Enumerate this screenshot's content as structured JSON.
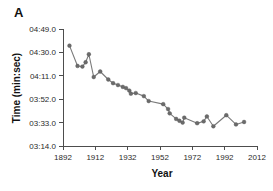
{
  "figure": {
    "panel_label": "A",
    "background_color": "#ffffff",
    "line_color": "#7a7a7a",
    "marker_color": "#6b6b6b",
    "axis_color": "#4d4d4d"
  },
  "chart_data": {
    "type": "line",
    "title": "",
    "xlabel": "Year",
    "ylabel": "Time (min:sec)",
    "xlim": [
      1892,
      2012
    ],
    "ylim": [
      194,
      289
    ],
    "xticks": [
      1892,
      1912,
      1932,
      1952,
      1972,
      1992,
      2012
    ],
    "xtick_labels": [
      "1892",
      "1912",
      "1932",
      "1952",
      "1972",
      "1992",
      "2012"
    ],
    "yticks": [
      194,
      213,
      232,
      251,
      270,
      289
    ],
    "ytick_labels": [
      "03:14.0",
      "03:33.0",
      "03:52.0",
      "04:11.0",
      "04:30.0",
      "04:49.0"
    ],
    "grid": false,
    "legend": false,
    "series": [
      {
        "name": "Mile record time",
        "x": [
          1896,
          1901,
          1904,
          1906,
          1908,
          1911,
          1915,
          1920,
          1923,
          1926,
          1929,
          1931,
          1933,
          1934,
          1937,
          1942,
          1945,
          1954,
          1957,
          1958,
          1962,
          1964,
          1966,
          1967,
          1975,
          1979,
          1981,
          1985,
          1993,
          1999,
          2004
        ],
        "y": [
          275.5,
          259.0,
          258.5,
          262.0,
          268.5,
          250.0,
          254.5,
          248.0,
          245.0,
          243.5,
          242.0,
          241.0,
          239.0,
          236.5,
          237.0,
          234.5,
          230.5,
          228.0,
          224.0,
          220.5,
          216.0,
          214.5,
          213.0,
          217.0,
          212.5,
          214.0,
          218.0,
          210.0,
          219.0,
          211.5,
          213.5
        ],
        "y_labels": [
          "04:35.5",
          "04:19.0",
          "04:18.5",
          "04:22.0",
          "04:28.5",
          "04:10.0",
          "04:14.5",
          "04:08.0",
          "04:05.0",
          "04:03.5",
          "04:02.0",
          "04:01.0",
          "03:59.0",
          "03:56.5",
          "03:57.0",
          "03:54.5",
          "03:50.5",
          "03:48.0",
          "03:44.0",
          "03:40.5",
          "03:36.0",
          "03:34.5",
          "03:33.0",
          "03:37.0",
          "03:32.5",
          "03:34.0",
          "03:38.0",
          "03:30.0",
          "03:39.0",
          "03:31.5",
          "03:33.5"
        ]
      }
    ]
  }
}
